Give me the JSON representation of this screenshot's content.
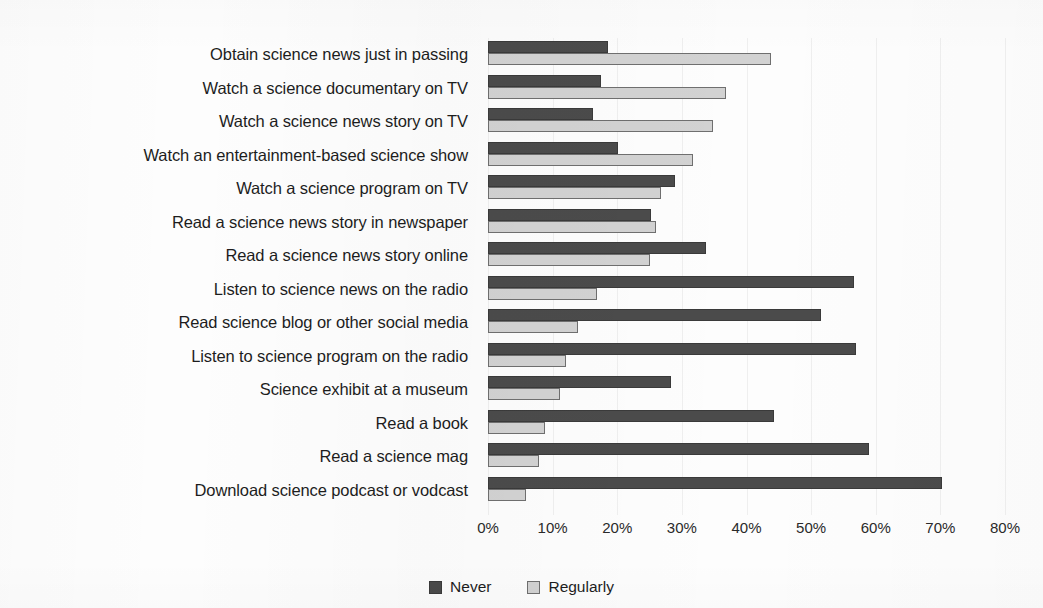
{
  "chart_data": {
    "type": "bar",
    "orientation": "horizontal",
    "title": "",
    "subtitle": "",
    "xlabel": "",
    "ylabel": "",
    "xlim": [
      0,
      80
    ],
    "xtick_labels": [
      "0%",
      "10%",
      "20%",
      "30%",
      "40%",
      "50%",
      "60%",
      "70%",
      "80%"
    ],
    "xtick_values": [
      0,
      10,
      20,
      30,
      40,
      50,
      60,
      70,
      80
    ],
    "grid": true,
    "legend_position": "bottom-center",
    "value_suffix": "%",
    "categories": [
      "Obtain science news just in passing",
      "Watch a science documentary on TV",
      "Watch a science news story on TV",
      "Watch an entertainment-based science show",
      "Watch a science program on TV",
      "Read a science news story in newspaper",
      "Read a science news story online",
      "Listen to science news on the radio",
      "Read science blog or other social media",
      "Listen to science program on the radio",
      "Science exhibit at a museum",
      "Read a book",
      "Read a science mag",
      "Download science podcast or vodcast"
    ],
    "series": [
      {
        "name": "Never",
        "color": "#4b4b4b",
        "values": [
          18.6,
          17.5,
          16.3,
          20.1,
          28.9,
          25.2,
          33.7,
          56.7,
          51.5,
          57.0,
          28.3,
          44.3,
          58.9,
          70.2
        ]
      },
      {
        "name": "Regularly",
        "color": "#d2d2d2",
        "values": [
          43.8,
          36.8,
          34.8,
          31.7,
          26.7,
          26.0,
          25.1,
          16.8,
          14.0,
          12.1,
          11.2,
          8.8,
          7.9,
          5.9
        ]
      }
    ]
  },
  "legend": {
    "entries": [
      {
        "label": "Never"
      },
      {
        "label": "Regularly"
      }
    ]
  }
}
